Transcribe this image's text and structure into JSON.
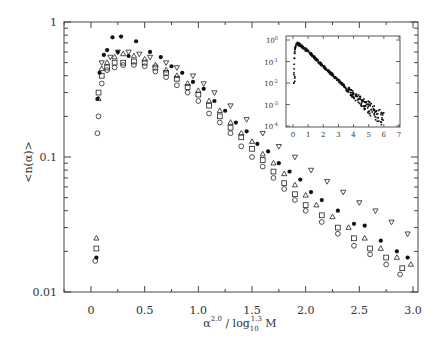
{
  "chart_data": {
    "type": "scatter",
    "title": "",
    "xlabel": "α^2.0 / log10^1.3 M",
    "xlabel_parts": {
      "base": "α",
      "sup1": "2.0",
      "slash": " / log",
      "sub": "10",
      "sup2": "1.3",
      "tail": " M"
    },
    "ylabel": "<n(α)>",
    "xlim": [
      -0.25,
      3.05
    ],
    "ylim": [
      0.01,
      1
    ],
    "yscale": "log",
    "grid": false,
    "legend": null,
    "x_ticks": [
      0,
      0.5,
      1.0,
      1.5,
      2.0,
      2.5,
      3.0
    ],
    "x_tick_labels": [
      "0",
      "0.5",
      "1.0",
      "1.5",
      "2.0",
      "2.5",
      "3.0"
    ],
    "y_ticks": [
      0.01,
      0.1,
      1
    ],
    "y_tick_labels": [
      "0.01",
      "0.1",
      "1"
    ],
    "series": [
      {
        "name": "filled circles",
        "marker": "filled-circle",
        "points": [
          [
            0.05,
            0.018
          ],
          [
            0.06,
            0.27
          ],
          [
            0.08,
            0.42
          ],
          [
            0.12,
            0.57
          ],
          [
            0.15,
            0.62
          ],
          [
            0.2,
            0.77
          ],
          [
            0.25,
            0.6
          ],
          [
            0.28,
            0.78
          ],
          [
            0.35,
            0.56
          ],
          [
            0.42,
            0.72
          ],
          [
            0.55,
            0.6
          ],
          [
            0.65,
            0.55
          ],
          [
            0.75,
            0.47
          ],
          [
            0.85,
            0.42
          ],
          [
            0.95,
            0.36
          ],
          [
            1.05,
            0.32
          ],
          [
            1.15,
            0.26
          ],
          [
            1.25,
            0.22
          ],
          [
            1.35,
            0.18
          ],
          [
            1.45,
            0.155
          ],
          [
            1.55,
            0.125
          ],
          [
            1.65,
            0.11
          ],
          [
            1.75,
            0.09
          ],
          [
            1.85,
            0.078
          ],
          [
            1.95,
            0.068
          ],
          [
            2.05,
            0.055
          ],
          [
            2.15,
            0.048
          ],
          [
            2.3,
            0.04
          ],
          [
            2.45,
            0.032
          ],
          [
            2.55,
            0.031
          ],
          [
            2.7,
            0.024
          ],
          [
            2.85,
            0.02
          ],
          [
            2.95,
            0.018
          ]
        ]
      },
      {
        "name": "open triangles",
        "marker": "open-triangle-up",
        "points": [
          [
            0.05,
            0.025
          ],
          [
            0.07,
            0.27
          ],
          [
            0.1,
            0.45
          ],
          [
            0.15,
            0.5
          ],
          [
            0.22,
            0.55
          ],
          [
            0.3,
            0.58
          ],
          [
            0.4,
            0.56
          ],
          [
            0.5,
            0.53
          ],
          [
            0.6,
            0.48
          ],
          [
            0.7,
            0.44
          ],
          [
            0.8,
            0.4
          ],
          [
            0.9,
            0.35
          ],
          [
            1.0,
            0.31
          ],
          [
            1.1,
            0.26
          ],
          [
            1.2,
            0.22
          ],
          [
            1.3,
            0.18
          ],
          [
            1.4,
            0.15
          ],
          [
            1.5,
            0.13
          ],
          [
            1.6,
            0.105
          ],
          [
            1.7,
            0.09
          ],
          [
            1.8,
            0.075
          ],
          [
            1.9,
            0.062
          ],
          [
            2.0,
            0.052
          ],
          [
            2.1,
            0.044
          ],
          [
            2.25,
            0.036
          ],
          [
            2.4,
            0.03
          ],
          [
            2.55,
            0.025
          ],
          [
            2.7,
            0.021
          ],
          [
            2.85,
            0.018
          ],
          [
            2.98,
            0.016
          ]
        ]
      },
      {
        "name": "open inverted triangles",
        "marker": "open-triangle-down",
        "points": [
          [
            0.1,
            0.5
          ],
          [
            0.18,
            0.55
          ],
          [
            0.25,
            0.6
          ],
          [
            0.35,
            0.6
          ],
          [
            0.45,
            0.58
          ],
          [
            0.55,
            0.55
          ],
          [
            0.7,
            0.5
          ],
          [
            0.8,
            0.46
          ],
          [
            0.95,
            0.4
          ],
          [
            1.05,
            0.35
          ],
          [
            1.15,
            0.3
          ],
          [
            1.3,
            0.24
          ],
          [
            1.45,
            0.19
          ],
          [
            1.6,
            0.15
          ],
          [
            1.75,
            0.12
          ],
          [
            1.9,
            0.1
          ],
          [
            2.05,
            0.08
          ],
          [
            2.2,
            0.066
          ],
          [
            2.35,
            0.055
          ],
          [
            2.5,
            0.046
          ],
          [
            2.65,
            0.04
          ],
          [
            2.8,
            0.033
          ],
          [
            2.95,
            0.027
          ]
        ]
      },
      {
        "name": "open squares",
        "marker": "open-square",
        "points": [
          [
            0.05,
            0.021
          ],
          [
            0.07,
            0.3
          ],
          [
            0.1,
            0.4
          ],
          [
            0.15,
            0.46
          ],
          [
            0.22,
            0.5
          ],
          [
            0.3,
            0.5
          ],
          [
            0.4,
            0.51
          ],
          [
            0.5,
            0.5
          ],
          [
            0.6,
            0.46
          ],
          [
            0.7,
            0.42
          ],
          [
            0.8,
            0.38
          ],
          [
            0.9,
            0.33
          ],
          [
            1.0,
            0.29
          ],
          [
            1.1,
            0.24
          ],
          [
            1.2,
            0.2
          ],
          [
            1.3,
            0.165
          ],
          [
            1.4,
            0.14
          ],
          [
            1.5,
            0.115
          ],
          [
            1.6,
            0.095
          ],
          [
            1.7,
            0.078
          ],
          [
            1.8,
            0.064
          ],
          [
            1.9,
            0.053
          ],
          [
            2.0,
            0.044
          ],
          [
            2.15,
            0.037
          ],
          [
            2.3,
            0.03
          ],
          [
            2.45,
            0.025
          ],
          [
            2.6,
            0.021
          ],
          [
            2.75,
            0.018
          ],
          [
            2.9,
            0.015
          ]
        ]
      },
      {
        "name": "open circles",
        "marker": "open-circle",
        "points": [
          [
            0.04,
            0.017
          ],
          [
            0.06,
            0.15
          ],
          [
            0.07,
            0.2
          ],
          [
            0.1,
            0.35
          ],
          [
            0.15,
            0.44
          ],
          [
            0.22,
            0.46
          ],
          [
            0.3,
            0.48
          ],
          [
            0.4,
            0.48
          ],
          [
            0.5,
            0.47
          ],
          [
            0.6,
            0.43
          ],
          [
            0.7,
            0.39
          ],
          [
            0.8,
            0.34
          ],
          [
            0.9,
            0.3
          ],
          [
            1.0,
            0.26
          ],
          [
            1.1,
            0.21
          ],
          [
            1.2,
            0.18
          ],
          [
            1.3,
            0.15
          ],
          [
            1.4,
            0.12
          ],
          [
            1.5,
            0.1
          ],
          [
            1.6,
            0.085
          ],
          [
            1.7,
            0.07
          ],
          [
            1.8,
            0.058
          ],
          [
            1.9,
            0.048
          ],
          [
            2.0,
            0.04
          ],
          [
            2.15,
            0.033
          ],
          [
            2.3,
            0.027
          ],
          [
            2.45,
            0.022
          ],
          [
            2.6,
            0.019
          ],
          [
            2.75,
            0.016
          ],
          [
            2.88,
            0.0135
          ]
        ]
      }
    ],
    "inset": {
      "type": "scatter",
      "yscale": "log",
      "xlim": [
        -0.5,
        7
      ],
      "ylim": [
        0.0001,
        1.2
      ],
      "x_ticks": [
        0,
        1,
        2,
        3,
        4,
        5,
        6,
        7
      ],
      "x_tick_labels": [
        "0",
        "1",
        "2",
        "3",
        "4",
        "5",
        "6",
        "7"
      ],
      "y_ticks": [
        1,
        0.1,
        0.01,
        0.001,
        0.0001
      ],
      "y_tick_labels": [
        "10^0",
        "10^-1",
        "10^-2",
        "10^-3",
        "10^-4"
      ],
      "y_tick_parts": [
        [
          "10",
          "0"
        ],
        [
          "10",
          "-1"
        ],
        [
          "10",
          "-2"
        ],
        [
          "10",
          "-3"
        ],
        [
          "10",
          "-4"
        ]
      ],
      "description": "Dense data collapse: sharp rise near x≈0.1 to peak ≈0.7 at x≈0.3, then approximately exponential decay to ≈1e-4 near x≈6, with scatter increasing beyond x≈4",
      "curve": [
        [
          0.05,
          0.01
        ],
        [
          0.08,
          0.1
        ],
        [
          0.12,
          0.35
        ],
        [
          0.2,
          0.6
        ],
        [
          0.3,
          0.7
        ],
        [
          0.5,
          0.55
        ],
        [
          1.0,
          0.3
        ],
        [
          1.5,
          0.13
        ],
        [
          2.0,
          0.06
        ],
        [
          2.5,
          0.028
        ],
        [
          3.0,
          0.013
        ],
        [
          3.5,
          0.006
        ],
        [
          4.0,
          0.0028
        ],
        [
          4.5,
          0.0014
        ],
        [
          5.0,
          0.0007
        ],
        [
          5.5,
          0.00035
        ],
        [
          6.0,
          0.00016
        ]
      ]
    }
  }
}
